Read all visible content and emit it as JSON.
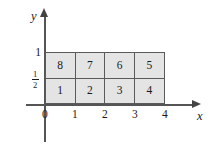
{
  "figure": {
    "type": "coordinate-grid-diagram",
    "axes": {
      "x_label": "x",
      "y_label": "y",
      "x_ticks": [
        "0",
        "1",
        "2",
        "3",
        "4"
      ],
      "y_ticks": [
        {
          "display": "1",
          "kind": "integer"
        },
        {
          "display": "1/2",
          "kind": "fraction",
          "numerator": "1",
          "denominator": "2"
        }
      ],
      "x_range": [
        0,
        4
      ],
      "y_range": [
        0,
        1
      ]
    },
    "grid": {
      "columns": 4,
      "rows": 2,
      "fill_color": "#e4e4e4",
      "border_color": "#5a5a5a",
      "rows_data": [
        {
          "name": "top-row",
          "y_span": [
            "1/2",
            "1"
          ],
          "cells": [
            "8",
            "7",
            "6",
            "5"
          ]
        },
        {
          "name": "bottom-row",
          "y_span": [
            "0",
            "1/2"
          ],
          "cells": [
            "1",
            "2",
            "3",
            "4"
          ]
        }
      ]
    }
  }
}
